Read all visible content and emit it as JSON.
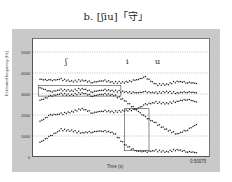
{
  "title": "b.  [ʃiu]「守」",
  "chart_data": {
    "type": "scatter",
    "title": "b. [ʃiu]「守」",
    "xlabel": "Time (s)",
    "ylabel": "Estimated frequency (Hz)",
    "xlim": [
      0,
      0.50075
    ],
    "ylim": [
      0,
      5700
    ],
    "yticks": [
      0,
      1000,
      2000,
      3000,
      4000,
      5000
    ],
    "xtick_labels": [
      "0",
      "0.50075"
    ],
    "grid": "horizontal dotted",
    "segment_labels": [
      {
        "text": "ʃ",
        "x": 0.08
      },
      {
        "text": "i",
        "x": 0.25
      },
      {
        "text": "u",
        "x": 0.32
      }
    ],
    "series": [
      {
        "name": "track-1",
        "x": [
          0.02,
          0.05,
          0.08,
          0.11,
          0.14,
          0.17,
          0.2,
          0.23,
          0.26,
          0.29,
          0.32,
          0.35,
          0.38,
          0.41,
          0.44,
          0.47
        ],
        "values": [
          3700,
          3650,
          3700,
          3600,
          3650,
          3550,
          3650,
          3550,
          3550,
          3650,
          3800,
          3450,
          3450,
          3600,
          3550,
          3500
        ]
      },
      {
        "name": "track-2",
        "x": [
          0.02,
          0.05,
          0.08,
          0.11,
          0.14,
          0.17,
          0.2,
          0.23,
          0.26,
          0.29,
          0.32,
          0.35,
          0.38,
          0.41,
          0.44,
          0.47
        ],
        "values": [
          3300,
          3100,
          3200,
          3150,
          3250,
          3100,
          3200,
          3150,
          3100,
          3050,
          3100,
          3050,
          3100,
          3050,
          3100,
          3050
        ]
      },
      {
        "name": "track-3",
        "x": [
          0.02,
          0.05,
          0.08,
          0.11,
          0.14,
          0.17,
          0.2,
          0.23,
          0.26,
          0.29,
          0.32,
          0.35,
          0.38,
          0.41,
          0.44,
          0.47
        ],
        "values": [
          2700,
          2900,
          3000,
          2950,
          3050,
          2900,
          3000,
          2950,
          2700,
          2300,
          1900,
          1600,
          1300,
          1100,
          1300,
          1600
        ]
      },
      {
        "name": "track-4",
        "x": [
          0.02,
          0.05,
          0.08,
          0.11,
          0.14,
          0.17,
          0.2,
          0.23,
          0.26,
          0.29,
          0.32,
          0.35,
          0.38,
          0.41,
          0.44,
          0.47
        ],
        "values": [
          1700,
          2000,
          2050,
          2150,
          2300,
          2100,
          2200,
          2150,
          2200,
          2250,
          2500,
          2600,
          2550,
          2650,
          2750,
          2600
        ]
      },
      {
        "name": "track-5",
        "x": [
          0.02,
          0.05,
          0.08,
          0.11,
          0.14,
          0.17,
          0.2,
          0.23,
          0.26,
          0.29,
          0.32,
          0.35,
          0.38,
          0.41,
          0.44,
          0.47
        ],
        "values": [
          700,
          1000,
          1300,
          1250,
          1150,
          1200,
          1250,
          1150,
          600,
          300,
          250,
          300,
          250,
          350,
          250,
          200
        ]
      }
    ],
    "annotations": [
      {
        "type": "rect",
        "x0": 0.015,
        "x1": 0.25,
        "y0": 2900,
        "y1": 3400
      },
      {
        "type": "rect",
        "x0": 0.26,
        "x1": 0.33,
        "y0": 300,
        "y1": 2300
      }
    ]
  },
  "axis": {
    "y_ticks": [
      "5000",
      "4000",
      "3000",
      "2000",
      "1000",
      "0"
    ],
    "x_end": "0.50075",
    "x_label": "Time (s)",
    "y_label": "Estimated frequency (Hz)"
  },
  "segments": [
    "ʃ",
    "i",
    "u"
  ]
}
